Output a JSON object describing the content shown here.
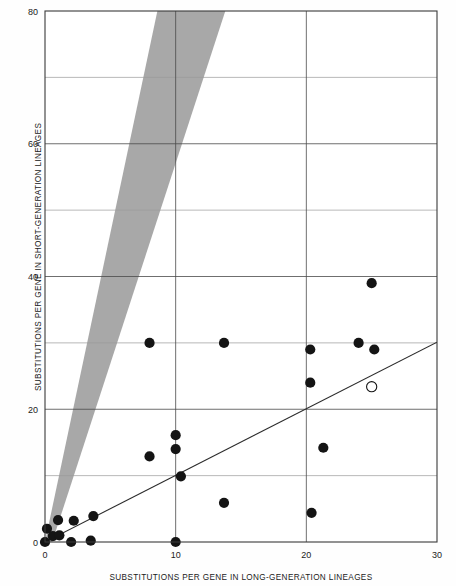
{
  "chart_data": {
    "type": "scatter",
    "title": "",
    "xlabel": "SUBSTITUTIONS PER GENE IN LONG-GENERATION LINEAGES",
    "ylabel": "SUBSTITUTIONS PER GENE IN SHORT-GENERATION LINEAGES",
    "xlim": [
      0,
      30
    ],
    "ylim": [
      0,
      80
    ],
    "xticks": [
      0,
      10,
      20,
      30
    ],
    "yticks": [
      0,
      20,
      40,
      60,
      80
    ],
    "xtick_labels": [
      "0",
      "10",
      "20",
      "30"
    ],
    "ytick_labels": [
      "0",
      "20",
      "40",
      "60",
      "80"
    ],
    "grid": true,
    "grid_minor_y": [
      10,
      30,
      50,
      70
    ],
    "legend": null,
    "series": [
      {
        "name": "filled-points",
        "marker": "filled-circle",
        "color": "#141414",
        "points": [
          [
            0.0,
            0.0
          ],
          [
            0.15,
            2.0
          ],
          [
            0.6,
            0.9
          ],
          [
            1.0,
            3.3
          ],
          [
            1.1,
            1.0
          ],
          [
            2.0,
            0.0
          ],
          [
            2.2,
            3.2
          ],
          [
            3.5,
            0.2
          ],
          [
            3.7,
            3.9
          ],
          [
            8.0,
            30.0
          ],
          [
            8.0,
            12.9
          ],
          [
            10.0,
            0.0
          ],
          [
            10.0,
            16.1
          ],
          [
            10.0,
            14.0
          ],
          [
            10.4,
            9.9
          ],
          [
            13.7,
            30.0
          ],
          [
            13.7,
            5.9
          ],
          [
            20.3,
            29.0
          ],
          [
            20.3,
            24.0
          ],
          [
            20.4,
            4.4
          ],
          [
            21.3,
            14.2
          ],
          [
            24.0,
            30.0
          ],
          [
            25.0,
            39.0
          ],
          [
            25.2,
            29.0
          ]
        ]
      },
      {
        "name": "open-point",
        "marker": "open-circle",
        "color": "#141414",
        "points": [
          [
            25.0,
            23.4
          ]
        ]
      }
    ],
    "annotations": [
      {
        "name": "regression-line",
        "type": "line",
        "from": [
          0,
          0
        ],
        "to": [
          30,
          30.1
        ],
        "color": "#2b2b2b"
      },
      {
        "name": "gray-confidence-wedge",
        "type": "polygon",
        "color": "#a8a8a8",
        "vertices": [
          [
            0,
            0
          ],
          [
            8.6,
            80
          ],
          [
            13.8,
            80
          ],
          [
            0.55,
            0
          ]
        ]
      }
    ]
  }
}
